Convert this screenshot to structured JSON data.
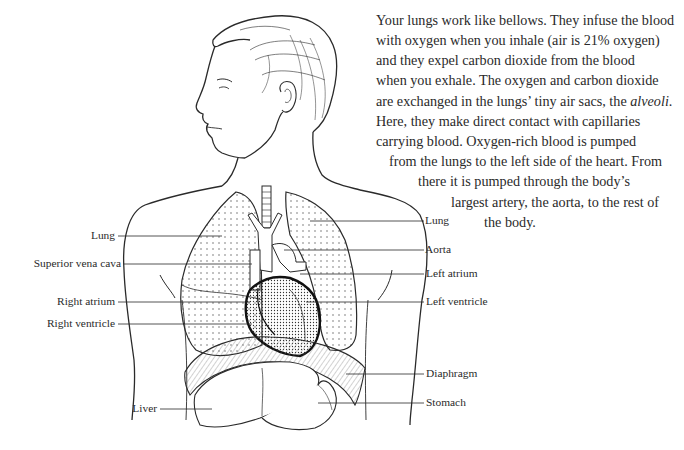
{
  "paragraph": {
    "lines": [
      "Your lungs work like bellows. They infuse the blood",
      "with oxygen when you inhale (air is 21% oxygen)",
      "and they expel carbon dioxide from the blood",
      "when you exhale. The oxygen and carbon dioxide",
      "are exchanged in the lungs’ tiny air sacs, the ",
      "Here, they make direct contact with capillaries",
      "carrying blood. Oxygen-rich blood is pumped",
      "from the lungs to the left side of the heart. From",
      "there it is pumped through the body’s",
      "largest artery, the aorta, to the rest of",
      "the body."
    ],
    "italic_term": "alveoli",
    "italic_suffix": "."
  },
  "labels": {
    "left": {
      "lung": "Lung",
      "superior_vena_cava": "Superior vena cava",
      "right_atrium": "Right atrium",
      "right_ventricle": "Right ventricle",
      "liver": "Liver"
    },
    "right": {
      "lung": "Lung",
      "aorta": "Aorta",
      "left_atrium": "Left atrium",
      "left_ventricle": "Left ventricle",
      "diaphragm": "Diaphragm",
      "stomach": "Stomach"
    }
  },
  "colors": {
    "ink": "#2a2a2a",
    "background": "#ffffff"
  }
}
